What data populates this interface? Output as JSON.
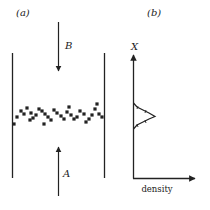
{
  "panel_a": {
    "label": "(a)",
    "arrow_top_label": "B",
    "arrow_bottom_label": "A",
    "particles": [
      [
        14,
        124
      ],
      [
        17,
        117
      ],
      [
        21,
        111
      ],
      [
        24,
        114
      ],
      [
        27,
        108
      ],
      [
        31,
        113
      ],
      [
        30,
        120
      ],
      [
        33,
        118
      ],
      [
        36,
        115
      ],
      [
        39,
        109
      ],
      [
        42,
        111
      ],
      [
        45,
        114
      ],
      [
        44,
        124
      ],
      [
        48,
        117
      ],
      [
        51,
        120
      ],
      [
        54,
        110
      ],
      [
        57,
        113
      ],
      [
        61,
        116
      ],
      [
        64,
        119
      ],
      [
        67,
        112
      ],
      [
        69,
        107
      ],
      [
        71,
        115
      ],
      [
        74,
        119
      ],
      [
        77,
        117
      ],
      [
        80,
        111
      ],
      [
        84,
        114
      ],
      [
        86,
        122
      ],
      [
        89,
        119
      ],
      [
        92,
        115
      ],
      [
        95,
        109
      ],
      [
        97,
        104
      ],
      [
        99,
        114
      ],
      [
        102,
        117
      ]
    ]
  },
  "panel_b": {
    "label": "(b)",
    "y_axis_label": "X",
    "x_axis_label": "density"
  },
  "colors": {
    "ink": "#222222",
    "background": "#ffffff"
  }
}
